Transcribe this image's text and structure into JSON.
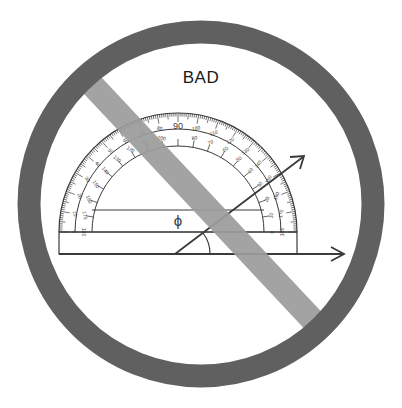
{
  "title": "BAD",
  "colors": {
    "ring": "#606060",
    "slash": "#9c9c9c",
    "line": "#3a3a3a",
    "background": "#ffffff"
  },
  "symbol": {
    "type": "prohibition-sign",
    "center": [
      201,
      204
    ],
    "radius": 172,
    "ring_width": 23
  },
  "protractor": {
    "center_mark": "ϕ",
    "top_label": "90",
    "outer_scale_labels": [
      "0",
      "10",
      "20",
      "30",
      "40",
      "50",
      "60",
      "70",
      "80",
      "90",
      "100",
      "110",
      "120",
      "130",
      "140",
      "150",
      "160",
      "170",
      "180"
    ],
    "inner_scale_labels": [
      "180",
      "170",
      "160",
      "150",
      "140",
      "130",
      "120",
      "110",
      "100",
      "90",
      "80",
      "70",
      "60",
      "50",
      "40",
      "30",
      "20",
      "10",
      "0"
    ],
    "base_left_labels": {
      "outer": "0",
      "inner": "180"
    },
    "base_right_labels": {
      "outer": "0",
      "inner": "180"
    }
  },
  "angle": {
    "rays": [
      "horizontal-arrow",
      "diagonal-arrow"
    ],
    "arc_marker": true
  }
}
